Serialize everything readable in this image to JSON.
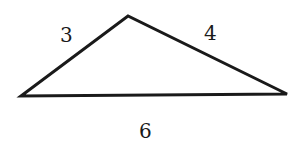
{
  "diagram": {
    "shape": "triangle",
    "vertices": {
      "left": [
        21,
        96
      ],
      "top": [
        128,
        16
      ],
      "right": [
        287,
        94
      ]
    },
    "side_labels": {
      "left_side": "3",
      "right_side": "4",
      "base": "6"
    },
    "stroke_color": "#1a1a1a",
    "fill_color": "#ffffff"
  }
}
